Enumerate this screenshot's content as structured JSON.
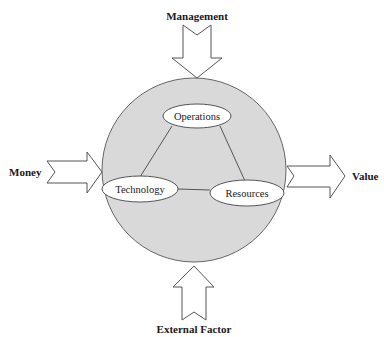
{
  "diagram": {
    "inputs": {
      "top": "Management",
      "left": "Money",
      "bottom": "External Factor"
    },
    "output": {
      "right": "Value"
    },
    "nodes": [
      {
        "id": "operations",
        "label": "Operations"
      },
      {
        "id": "technology",
        "label": "Technology"
      },
      {
        "id": "resources",
        "label": "Resources"
      }
    ],
    "edges": [
      [
        "operations",
        "technology"
      ],
      [
        "operations",
        "resources"
      ],
      [
        "technology",
        "resources"
      ]
    ],
    "colors": {
      "circle_fill": "#d9d9d9",
      "stroke": "#555555",
      "node_fill": "#ffffff"
    }
  }
}
